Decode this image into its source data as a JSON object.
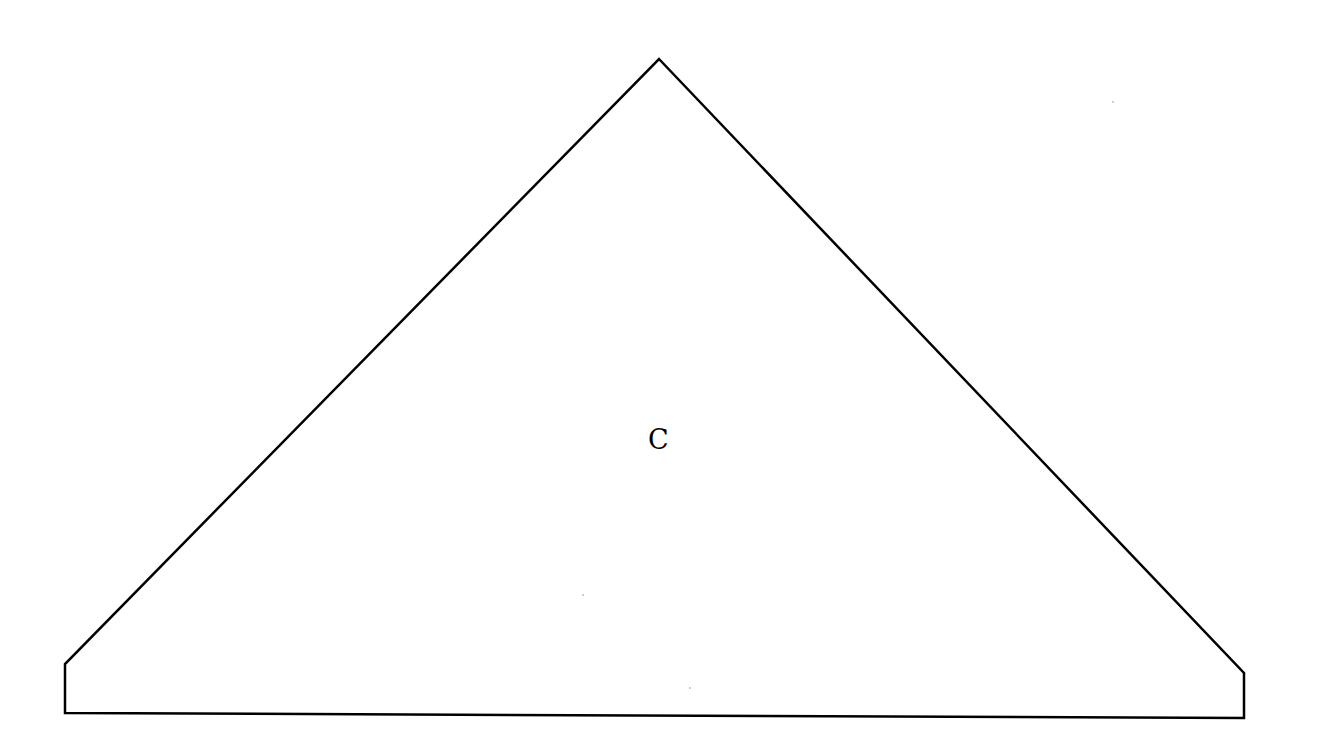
{
  "diagram": {
    "shape": "pentagon",
    "label": "C",
    "stroke_color": "#000000",
    "fill_color": "#ffffff",
    "stroke_width": 2.5,
    "vertices": [
      {
        "name": "apex",
        "x": 659,
        "y": 59
      },
      {
        "name": "right-shoulder",
        "x": 1244,
        "y": 673
      },
      {
        "name": "bottom-right",
        "x": 1244,
        "y": 718
      },
      {
        "name": "bottom-left",
        "x": 65,
        "y": 713
      },
      {
        "name": "left-shoulder",
        "x": 65,
        "y": 664
      }
    ]
  }
}
